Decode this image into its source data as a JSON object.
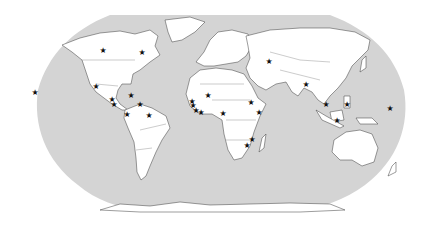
{
  "map": {
    "projection": "Robinson",
    "ocean_color": "#d4d4d4",
    "land_color": "#ffffff",
    "border_color": "#3a3a3a",
    "marker_color": "#111111",
    "marker_symbol": "★",
    "markers": [
      {
        "region": "north-pacific-hawaii",
        "x": 35,
        "y": 92
      },
      {
        "region": "western-canada",
        "x": 103,
        "y": 50
      },
      {
        "region": "eastern-canada",
        "x": 142,
        "y": 52
      },
      {
        "region": "mexico",
        "x": 96,
        "y": 86
      },
      {
        "region": "guatemala",
        "x": 112,
        "y": 99
      },
      {
        "region": "honduras-nicaragua",
        "x": 114,
        "y": 104
      },
      {
        "region": "caribbean",
        "x": 131,
        "y": 95
      },
      {
        "region": "panama-colombia-north",
        "x": 140,
        "y": 104
      },
      {
        "region": "colombia",
        "x": 127,
        "y": 114
      },
      {
        "region": "guyana",
        "x": 149,
        "y": 115
      },
      {
        "region": "mali",
        "x": 208,
        "y": 95
      },
      {
        "region": "guinea",
        "x": 192,
        "y": 101
      },
      {
        "region": "sierra-leone",
        "x": 193,
        "y": 105
      },
      {
        "region": "liberia",
        "x": 196,
        "y": 110
      },
      {
        "region": "cote-divoire",
        "x": 201,
        "y": 112
      },
      {
        "region": "cameroon",
        "x": 223,
        "y": 113
      },
      {
        "region": "ethiopia",
        "x": 251,
        "y": 102
      },
      {
        "region": "kenya-somalia",
        "x": 259,
        "y": 112
      },
      {
        "region": "malawi",
        "x": 252,
        "y": 139
      },
      {
        "region": "mozambique",
        "x": 247,
        "y": 145
      },
      {
        "region": "central-asia",
        "x": 269,
        "y": 61
      },
      {
        "region": "bangladesh",
        "x": 306,
        "y": 84
      },
      {
        "region": "cambodia",
        "x": 326,
        "y": 104
      },
      {
        "region": "philippines",
        "x": 347,
        "y": 104
      },
      {
        "region": "indonesia",
        "x": 337,
        "y": 120
      },
      {
        "region": "micronesia",
        "x": 390,
        "y": 108
      }
    ]
  }
}
